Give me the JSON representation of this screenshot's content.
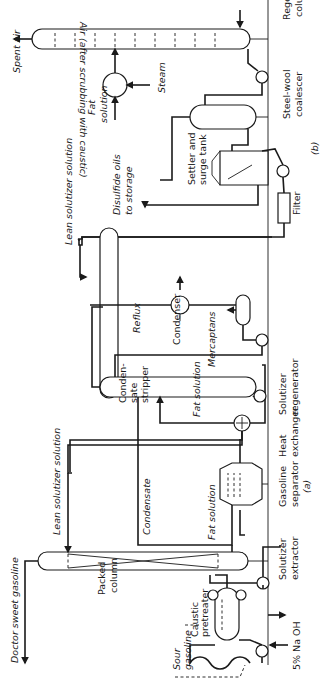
{
  "figure": {
    "panel_a_label": "(a)",
    "panel_b_label": "(b)",
    "orientation": "rotated 90° counter-clockwise"
  },
  "equipment": {
    "regenerator_column": [
      "Regenerator",
      "column"
    ],
    "steel_wool_coalescer": [
      "Steel-wool",
      "coalescer"
    ],
    "settler_surge_tank": [
      "Settler and",
      "surge tank"
    ],
    "filter": "Filter",
    "solutizer_regenerator": [
      "Solutizer",
      "regenerator"
    ],
    "heat_exchanger": [
      "Heat",
      "exchanger"
    ],
    "condenser": "Condenser",
    "condensate_stripper": [
      "Conden-",
      "sate",
      "stripper"
    ],
    "gasoline_separator": [
      "Gasoline",
      "separator"
    ],
    "solutizer_extractor": [
      "Solutizer",
      "extractor"
    ],
    "packed_column": [
      "Packed",
      "column"
    ],
    "caustic_pretreater": [
      "Caustic",
      "pretreater"
    ]
  },
  "streams": {
    "air_in": "Air (after scrubbing with caustic)",
    "spent_air": "Spent air",
    "steam": "Steam",
    "fat_solution_b": [
      "Fat",
      "solution"
    ],
    "disulfide_oils": [
      "Disulfide oils",
      "to storage"
    ],
    "lean_solution_top": "Lean solutizer solution",
    "lean_solution_mid": "Lean solutizer solution",
    "reflux": "Reflux",
    "mercaptans": "Mercaptans",
    "fat_solution_1": "Fat solution",
    "fat_solution_2": "Fat solution",
    "condensate": "Condensate",
    "doctor_sweet": "Doctor sweet gasoline",
    "sour_gasoline": [
      "Sour",
      "gasoline"
    ],
    "naoh": "5% Na OH"
  },
  "colors": {
    "ink": "#1a1a1a",
    "paper": "#ffffff"
  }
}
